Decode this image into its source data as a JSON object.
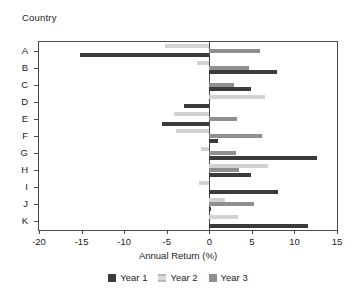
{
  "chart_data": {
    "type": "bar",
    "orientation": "horizontal",
    "title": "",
    "xlabel": "Annual Return (%)",
    "ylabel": "Country",
    "categories": [
      "A",
      "B",
      "C",
      "D",
      "E",
      "F",
      "G",
      "H",
      "I",
      "J",
      "K"
    ],
    "xticks": [
      -20,
      -15,
      -10,
      -5,
      0,
      5,
      10,
      15
    ],
    "xlim": [
      -20,
      15
    ],
    "grid": false,
    "legend_position": "bottom",
    "series": [
      {
        "name": "Year 1",
        "color": "#3b3b3b",
        "values": [
          -15.2,
          7.9,
          4.9,
          -3.0,
          -5.6,
          1.0,
          12.7,
          4.9,
          8.1,
          0.2,
          11.6
        ]
      },
      {
        "name": "Year 2",
        "color": "#d9d9d9",
        "values": [
          -5.2,
          -1.5,
          0.0,
          6.6,
          -4.2,
          -3.9,
          -1.0,
          6.9,
          -1.2,
          1.8,
          3.4
        ]
      },
      {
        "name": "Year 3",
        "color": "#8f8f8f",
        "values": [
          6.0,
          4.7,
          2.9,
          0.0,
          3.2,
          6.2,
          3.1,
          3.5,
          0.0,
          5.3,
          0.0
        ]
      }
    ]
  },
  "axes": {
    "y_title": "Country",
    "x_title": "Annual Return (%)",
    "x_tick_labels": [
      "-20",
      "-15",
      "-10",
      "-5",
      "0",
      "5",
      "10",
      "15"
    ],
    "y_tick_labels": [
      "A",
      "B",
      "C",
      "D",
      "E",
      "F",
      "G",
      "H",
      "I",
      "J",
      "K"
    ]
  },
  "legend": {
    "items": [
      {
        "label": "Year 1",
        "key": "y1"
      },
      {
        "label": "Year 2",
        "key": "y2"
      },
      {
        "label": "Year 3",
        "key": "y3"
      }
    ]
  }
}
